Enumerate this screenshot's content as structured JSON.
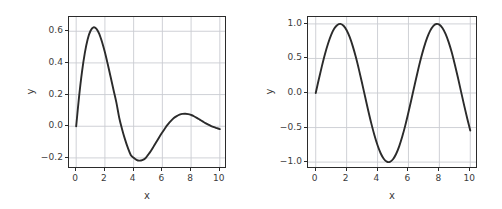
{
  "figure": {
    "background_color": "#ffffff",
    "line_color": "#2b2b2b",
    "grid_color": "#c9ccd1",
    "axes_color": "#2b2b2b",
    "tick_text_color": "#3b3b3b"
  },
  "chart_data": [
    {
      "type": "line",
      "id": "damped-sine",
      "title": "",
      "xlabel": "x",
      "ylabel": "y",
      "xlim": [
        -0.5,
        10.5
      ],
      "ylim": [
        -0.27,
        0.69
      ],
      "xticks": [
        0,
        2,
        4,
        6,
        8,
        10
      ],
      "xtick_labels": [
        "0",
        "2",
        "4",
        "6",
        "8",
        "10"
      ],
      "yticks": [
        -0.2,
        0.0,
        0.2,
        0.4,
        0.6
      ],
      "ytick_labels": [
        "−0.2",
        "0.0",
        "0.2",
        "0.4",
        "0.6"
      ],
      "grid": true,
      "legend": "none",
      "series": [
        {
          "name": "sin(x)*exp(-x/3)",
          "x": [
            0.0,
            0.2,
            0.4,
            0.6,
            0.8,
            1.0,
            1.2,
            1.4,
            1.6,
            1.8,
            2.0,
            2.2,
            2.4,
            2.6,
            2.8,
            3.0,
            3.2,
            3.4,
            3.6,
            3.8,
            4.0,
            4.2,
            4.4,
            4.6,
            4.8,
            5.0,
            5.2,
            5.4,
            5.6,
            5.8,
            6.0,
            6.2,
            6.4,
            6.6,
            6.8,
            7.0,
            7.2,
            7.4,
            7.6,
            7.8,
            8.0,
            8.2,
            8.4,
            8.6,
            8.8,
            9.0,
            9.2,
            9.4,
            9.6,
            9.8,
            10.0
          ],
          "y": [
            0.0,
            0.186,
            0.341,
            0.462,
            0.55,
            0.603,
            0.625,
            0.617,
            0.585,
            0.532,
            0.467,
            0.391,
            0.311,
            0.229,
            0.149,
            0.052,
            -0.02,
            -0.083,
            -0.137,
            -0.181,
            -0.199,
            -0.212,
            -0.217,
            -0.214,
            -0.204,
            -0.181,
            -0.156,
            -0.127,
            -0.097,
            -0.066,
            -0.038,
            -0.011,
            0.013,
            0.034,
            0.052,
            0.064,
            0.073,
            0.078,
            0.079,
            0.077,
            0.071,
            0.063,
            0.053,
            0.042,
            0.031,
            0.02,
            0.01,
            0.001,
            -0.006,
            -0.012,
            -0.018
          ]
        }
      ]
    },
    {
      "type": "line",
      "id": "sine",
      "title": "",
      "xlabel": "x",
      "ylabel": "y",
      "xlim": [
        -0.5,
        10.5
      ],
      "ylim": [
        -1.1,
        1.1
      ],
      "xticks": [
        0,
        2,
        4,
        6,
        8,
        10
      ],
      "xtick_labels": [
        "0",
        "2",
        "4",
        "6",
        "8",
        "10"
      ],
      "yticks": [
        -1.0,
        -0.5,
        0.0,
        0.5,
        1.0
      ],
      "ytick_labels": [
        "−1.0",
        "−0.5",
        "0.0",
        "0.5",
        "1.0"
      ],
      "grid": true,
      "legend": "none",
      "series": [
        {
          "name": "sin(x)",
          "x": [
            0.0,
            0.2,
            0.4,
            0.6,
            0.8,
            1.0,
            1.2,
            1.4,
            1.6,
            1.8,
            2.0,
            2.2,
            2.4,
            2.6,
            2.8,
            3.0,
            3.2,
            3.4,
            3.6,
            3.8,
            4.0,
            4.2,
            4.4,
            4.6,
            4.8,
            5.0,
            5.2,
            5.4,
            5.6,
            5.8,
            6.0,
            6.2,
            6.4,
            6.6,
            6.8,
            7.0,
            7.2,
            7.4,
            7.6,
            7.8,
            8.0,
            8.2,
            8.4,
            8.6,
            8.8,
            9.0,
            9.2,
            9.4,
            9.6,
            9.8,
            10.0
          ],
          "y": [
            0.0,
            0.199,
            0.389,
            0.565,
            0.717,
            0.841,
            0.932,
            0.985,
            1.0,
            0.974,
            0.909,
            0.808,
            0.675,
            0.516,
            0.335,
            0.141,
            -0.058,
            -0.256,
            -0.443,
            -0.612,
            -0.757,
            -0.872,
            -0.952,
            -0.994,
            -0.996,
            -0.959,
            -0.883,
            -0.773,
            -0.631,
            -0.465,
            -0.279,
            -0.083,
            0.117,
            0.312,
            0.495,
            0.657,
            0.794,
            0.9,
            0.969,
            0.999,
            0.989,
            0.941,
            0.855,
            0.736,
            0.588,
            0.412,
            0.223,
            0.024,
            -0.175,
            -0.366,
            -0.544
          ]
        }
      ]
    }
  ]
}
